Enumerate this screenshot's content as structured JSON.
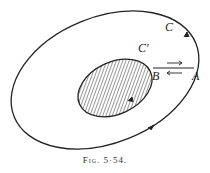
{
  "figure": {
    "caption": "Fig. 5·54.",
    "labels": {
      "outer_curve": "C",
      "inner_curve": "C′",
      "point_a": "A",
      "point_b": "B"
    },
    "colors": {
      "ink": "#222222",
      "background": "#ffffff"
    }
  }
}
